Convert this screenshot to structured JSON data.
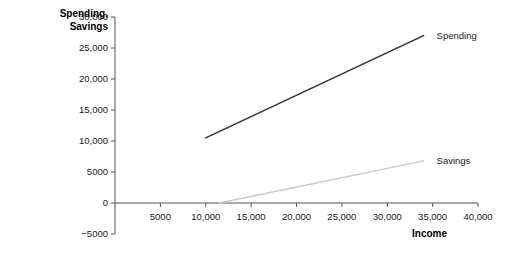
{
  "chart_data": {
    "type": "line",
    "title": "",
    "xlabel": "Income",
    "ylabel": "Spending, Savings",
    "xlim": [
      0,
      40000
    ],
    "ylim": [
      -5000,
      30000
    ],
    "grid": false,
    "legend_position": "inline-right-of-line-ends",
    "x_ticks": [
      {
        "value": 5000,
        "label": "5000"
      },
      {
        "value": 10000,
        "label": "10,000"
      },
      {
        "value": 15000,
        "label": "15,000"
      },
      {
        "value": 20000,
        "label": "20,000"
      },
      {
        "value": 25000,
        "label": "25,000"
      },
      {
        "value": 30000,
        "label": "30,000"
      },
      {
        "value": 35000,
        "label": "35,000"
      },
      {
        "value": 40000,
        "label": "40,000"
      }
    ],
    "y_ticks": [
      {
        "value": 30000,
        "label": "30,000"
      },
      {
        "value": 25000,
        "label": "25,000"
      },
      {
        "value": 20000,
        "label": "20,000"
      },
      {
        "value": 15000,
        "label": "15,000"
      },
      {
        "value": 10000,
        "label": "10,000"
      },
      {
        "value": 5000,
        "label": "5000"
      },
      {
        "value": 0,
        "label": "0"
      },
      {
        "value": -5000,
        "label": "−5000"
      }
    ],
    "series": [
      {
        "name": "Spending",
        "color": "#333333",
        "width": 1.6,
        "points": [
          {
            "x": 10000,
            "y": 10500
          },
          {
            "x": 34000,
            "y": 27000
          }
        ]
      },
      {
        "name": "Savings",
        "color": "#c8c8c8",
        "width": 1.4,
        "points": [
          {
            "x": 11500,
            "y": 0
          },
          {
            "x": 34000,
            "y": 6800
          }
        ]
      }
    ],
    "axis_color": "#555555"
  },
  "labels": {
    "y_axis_title": "Spending,\nSavings",
    "x_axis_title": "Income",
    "spending_series_label": "Spending",
    "savings_series_label": "Savings"
  }
}
